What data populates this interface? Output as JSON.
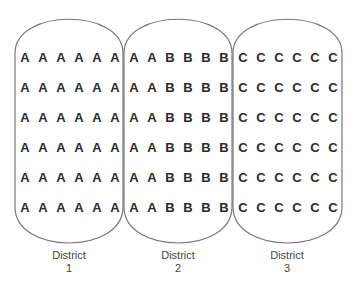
{
  "diagram": {
    "type": "districting-grid",
    "rows": 6,
    "cols_per_district": 6,
    "colors": {
      "outline": "#777777",
      "letter": "#2a2a2a",
      "label": "#444444",
      "background": "#ffffff"
    },
    "districts": [
      {
        "name": "District",
        "number": "1",
        "grid": [
          [
            "A",
            "A",
            "A",
            "A",
            "A",
            "A"
          ],
          [
            "A",
            "A",
            "A",
            "A",
            "A",
            "A"
          ],
          [
            "A",
            "A",
            "A",
            "A",
            "A",
            "A"
          ],
          [
            "A",
            "A",
            "A",
            "A",
            "A",
            "A"
          ],
          [
            "A",
            "A",
            "A",
            "A",
            "A",
            "A"
          ],
          [
            "A",
            "A",
            "A",
            "A",
            "A",
            "A"
          ]
        ]
      },
      {
        "name": "District",
        "number": "2",
        "grid": [
          [
            "A",
            "A",
            "B",
            "B",
            "B",
            "B"
          ],
          [
            "A",
            "A",
            "B",
            "B",
            "B",
            "B"
          ],
          [
            "A",
            "A",
            "B",
            "B",
            "B",
            "B"
          ],
          [
            "A",
            "A",
            "B",
            "B",
            "B",
            "B"
          ],
          [
            "A",
            "A",
            "B",
            "B",
            "B",
            "B"
          ],
          [
            "A",
            "A",
            "B",
            "B",
            "B",
            "B"
          ]
        ]
      },
      {
        "name": "District",
        "number": "3",
        "grid": [
          [
            "C",
            "C",
            "C",
            "C",
            "C",
            "C"
          ],
          [
            "C",
            "C",
            "C",
            "C",
            "C",
            "C"
          ],
          [
            "C",
            "C",
            "C",
            "C",
            "C",
            "C"
          ],
          [
            "C",
            "C",
            "C",
            "C",
            "C",
            "C"
          ],
          [
            "C",
            "C",
            "C",
            "C",
            "C",
            "C"
          ],
          [
            "C",
            "C",
            "C",
            "C",
            "C",
            "C"
          ]
        ]
      }
    ]
  }
}
